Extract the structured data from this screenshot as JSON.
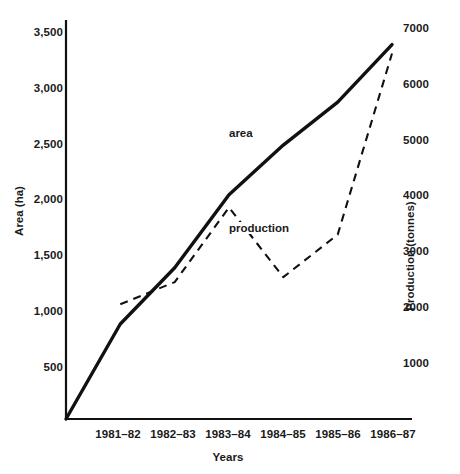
{
  "chart_data": {
    "type": "line",
    "title": "",
    "xlabel": "Years",
    "ylabel": "Area  (ha)",
    "y2label": "Production  (tonnes)",
    "grid": false,
    "legend_position": "inline-annotation",
    "categories": [
      "1981–82",
      "1982–83",
      "1983–84",
      "1984–85",
      "1985–86",
      "1986–87"
    ],
    "ylim": [
      0,
      3500
    ],
    "yticks": [
      "500",
      "1,000",
      "1,500",
      "2,000",
      "2,500",
      "3,000",
      "3,500"
    ],
    "ytick_values": [
      500,
      1000,
      1500,
      2000,
      2500,
      3000,
      3500
    ],
    "y2lim": [
      0,
      7000
    ],
    "y2ticks": [
      "1000",
      "2000",
      "3000",
      "4000",
      "5000",
      "6000",
      "7000"
    ],
    "y2tick_values": [
      1000,
      2000,
      3000,
      4000,
      5000,
      6000,
      7000
    ],
    "series": [
      {
        "name": "area",
        "axis": "left",
        "style": "solid",
        "unit": "ha",
        "values": [
          860,
          1370,
          2030,
          2480,
          2870,
          3390
        ]
      },
      {
        "name": "production",
        "axis": "right",
        "style": "dashed",
        "unit": "tonnes",
        "values": [
          2080,
          2480,
          3830,
          2570,
          3340,
          6620
        ]
      }
    ],
    "annotations": [
      {
        "text": "area",
        "series": "area"
      },
      {
        "text": "production",
        "series": "production"
      }
    ]
  }
}
